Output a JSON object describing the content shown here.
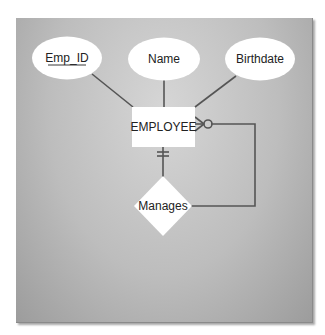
{
  "diagram": {
    "type": "ER diagram (crow's foot, unary relationship)",
    "entity": {
      "label": "EMPLOYEE"
    },
    "attributes": [
      {
        "label": "Emp_ID",
        "primary_key": true
      },
      {
        "label": "Name",
        "primary_key": false
      },
      {
        "label": "Birthdate",
        "primary_key": false
      }
    ],
    "relationship": {
      "label": "Manages",
      "cardinality_entity_side": "mandatory one (||)",
      "cardinality_loop_side": "optional many (o<)"
    },
    "colors": {
      "panel_light": "#d6d6d6",
      "panel_dark": "#9c9c9c",
      "shape_fill": "#ffffff",
      "line": "#555555",
      "text": "#222222"
    }
  }
}
